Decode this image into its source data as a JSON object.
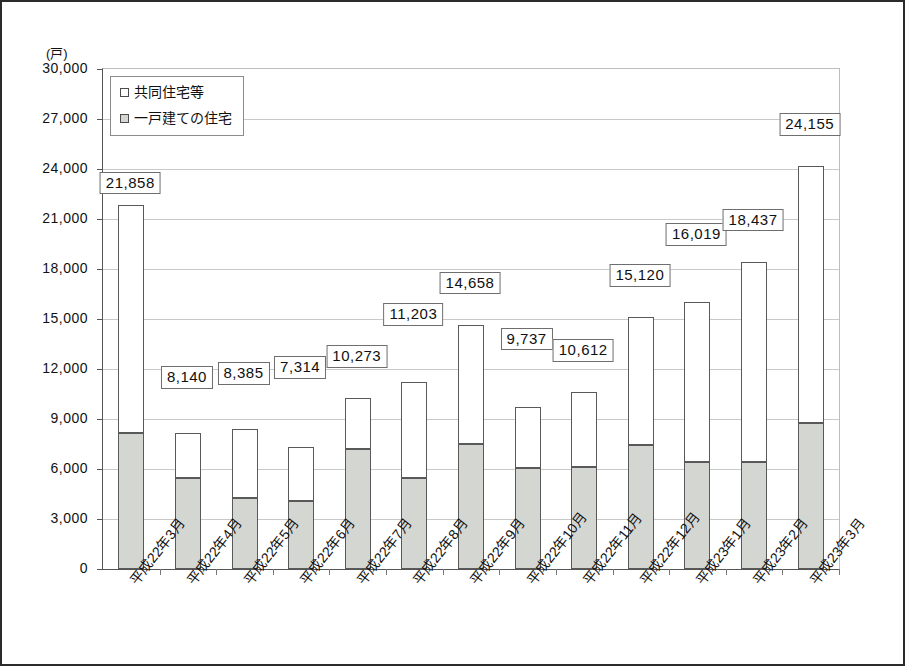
{
  "chart_data": {
    "type": "bar",
    "stacked": true,
    "title": "",
    "subtitle": "",
    "xlabel": "",
    "ylabel": "(戸)",
    "unit_caption": "(戸)",
    "ylim": [
      0,
      30000
    ],
    "ytick_step": 3000,
    "ytick_labels": [
      "30,000",
      "27,000",
      "24,000",
      "21,000",
      "18,000",
      "15,000",
      "12,000",
      "9,000",
      "6,000",
      "3,000",
      "0"
    ],
    "ytick_values": [
      30000,
      27000,
      24000,
      21000,
      18000,
      15000,
      12000,
      9000,
      6000,
      3000,
      0
    ],
    "grid": true,
    "legend_position": "top-left",
    "categories": [
      "平成22年3月",
      "平成22年4月",
      "平成22年5月",
      "平成22年6月",
      "平成22年7月",
      "平成22年8月",
      "平成22年9月",
      "平成22年10月",
      "平成22年11月",
      "平成22年12月",
      "平成23年1月",
      "平成23年2月",
      "平成23年3月"
    ],
    "series": [
      {
        "name": "一戸建ての住宅",
        "legend_marker": "square-gray",
        "color": "#d4d6d2",
        "values": [
          8160,
          5460,
          4260,
          4080,
          7200,
          5460,
          7500,
          6060,
          6120,
          7440,
          6420,
          6420,
          8760
        ]
      },
      {
        "name": "共同住宅等",
        "legend_marker": "square-white",
        "color": "#ffffff",
        "values": [
          13698,
          2680,
          4125,
          3234,
          3073,
          5743,
          7158,
          3677,
          4492,
          7680,
          9599,
          12017,
          15395
        ]
      }
    ],
    "totals": [
      21858,
      8140,
      8385,
      7314,
      10273,
      11203,
      14658,
      9737,
      10612,
      15120,
      16019,
      18437,
      24155
    ],
    "total_labels": [
      "21,858",
      "8,140",
      "8,385",
      "7,314",
      "10,273",
      "11,203",
      "14,658",
      "9,737",
      "10,612",
      "15,120",
      "16,019",
      "18,437",
      "24,155"
    ],
    "label_offsets_px": [
      18,
      52,
      52,
      76,
      38,
      64,
      38,
      64,
      38,
      38,
      64,
      38,
      38
    ]
  },
  "legend": {
    "items": [
      {
        "label": "共同住宅等",
        "marker": "square-white"
      },
      {
        "label": "一戸建ての住宅",
        "marker": "square-gray"
      }
    ]
  }
}
